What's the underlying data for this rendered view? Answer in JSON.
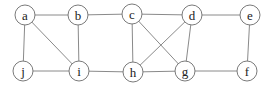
{
  "graph": {
    "node_radius": 10,
    "colors": {
      "edge": "#8a8a8a",
      "node_stroke": "#7a7a7a",
      "node_fill": "#ffffff",
      "label": "#222222"
    },
    "nodes": [
      {
        "id": "a",
        "label": "a",
        "x": 25,
        "y": 15
      },
      {
        "id": "b",
        "label": "b",
        "x": 78,
        "y": 15
      },
      {
        "id": "c",
        "label": "c",
        "x": 132,
        "y": 14
      },
      {
        "id": "d",
        "label": "d",
        "x": 192,
        "y": 15
      },
      {
        "id": "e",
        "label": "e",
        "x": 250,
        "y": 15
      },
      {
        "id": "j",
        "label": "j",
        "x": 23,
        "y": 71
      },
      {
        "id": "i",
        "label": "i",
        "x": 79,
        "y": 71
      },
      {
        "id": "h",
        "label": "h",
        "x": 133,
        "y": 72
      },
      {
        "id": "g",
        "label": "g",
        "x": 185,
        "y": 71
      },
      {
        "id": "f",
        "label": "f",
        "x": 247,
        "y": 71
      }
    ],
    "edges": [
      [
        "a",
        "b"
      ],
      [
        "a",
        "j"
      ],
      [
        "a",
        "i"
      ],
      [
        "b",
        "i"
      ],
      [
        "b",
        "c"
      ],
      [
        "j",
        "i"
      ],
      [
        "i",
        "h"
      ],
      [
        "c",
        "d"
      ],
      [
        "c",
        "h"
      ],
      [
        "c",
        "g"
      ],
      [
        "d",
        "h"
      ],
      [
        "d",
        "g"
      ],
      [
        "d",
        "e"
      ],
      [
        "h",
        "g"
      ],
      [
        "g",
        "f"
      ],
      [
        "e",
        "f"
      ]
    ]
  }
}
